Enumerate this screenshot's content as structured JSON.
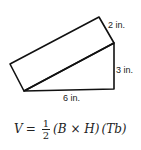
{
  "figure": {
    "type": "triangular prism (2D oblique view)",
    "labels": {
      "depth": "2 in.",
      "height": "3 in.",
      "base": "6 in."
    },
    "stroke_color": "#111111"
  },
  "formula": {
    "lhs": "V",
    "equals": "=",
    "numerator": "1",
    "denominator": "2",
    "factor1": "(B × H)",
    "factor2": "(Tb)"
  }
}
